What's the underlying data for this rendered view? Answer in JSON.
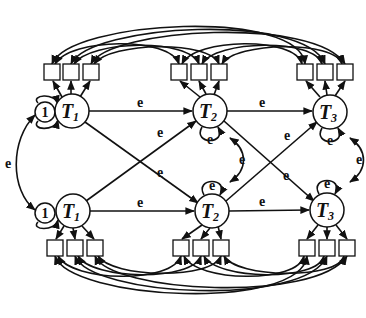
{
  "diagram": {
    "type": "structural-equation-path-model",
    "rows": [
      {
        "position": "top",
        "nodes": [
          {
            "id": "T1_top",
            "label": "T",
            "subscript": "1",
            "cx": 72,
            "cy": 111
          },
          {
            "id": "T2_top",
            "label": "T",
            "subscript": "2",
            "cx": 210,
            "cy": 111
          },
          {
            "id": "T3_top",
            "label": "T",
            "subscript": "3",
            "cx": 330,
            "cy": 112
          }
        ],
        "constant": {
          "label": "1",
          "cx": 45,
          "cy": 112
        }
      },
      {
        "position": "bottom",
        "nodes": [
          {
            "id": "T1_bottom",
            "label": "T",
            "subscript": "1",
            "cx": 73,
            "cy": 211
          },
          {
            "id": "T2_bottom",
            "label": "T",
            "subscript": "2",
            "cx": 212,
            "cy": 211
          },
          {
            "id": "T3_bottom",
            "label": "T",
            "subscript": "3",
            "cx": 327,
            "cy": 210
          }
        ],
        "constant": {
          "label": "1",
          "cx": 45,
          "cy": 213
        }
      }
    ],
    "indicators_per_node": 3,
    "edge_label": "e",
    "edges": [
      {
        "from": "T1_top",
        "to": "T2_top",
        "label": "e"
      },
      {
        "from": "T2_top",
        "to": "T3_top",
        "label": "e"
      },
      {
        "from": "T1_bottom",
        "to": "T2_bottom",
        "label": "e"
      },
      {
        "from": "T2_bottom",
        "to": "T3_bottom",
        "label": "e"
      },
      {
        "from": "T1_top",
        "to": "T2_bottom",
        "label": "e"
      },
      {
        "from": "T1_bottom",
        "to": "T2_top",
        "label": "e"
      },
      {
        "from": "T2_top",
        "to": "T3_bottom",
        "label": "e"
      },
      {
        "from": "T2_bottom",
        "to": "T3_top",
        "label": "e"
      }
    ],
    "residual_label": "e",
    "covariances": [
      {
        "between": [
          "const_top",
          "const_bottom"
        ],
        "label": "e"
      },
      {
        "between": [
          "T2_top",
          "T2_bottom"
        ],
        "label": "e"
      },
      {
        "between": [
          "T3_top",
          "T3_bottom"
        ],
        "label": "e"
      }
    ],
    "labels": {
      "T": "T",
      "s1": "1",
      "s2": "2",
      "s3": "3",
      "one": "1",
      "e": "e"
    }
  }
}
